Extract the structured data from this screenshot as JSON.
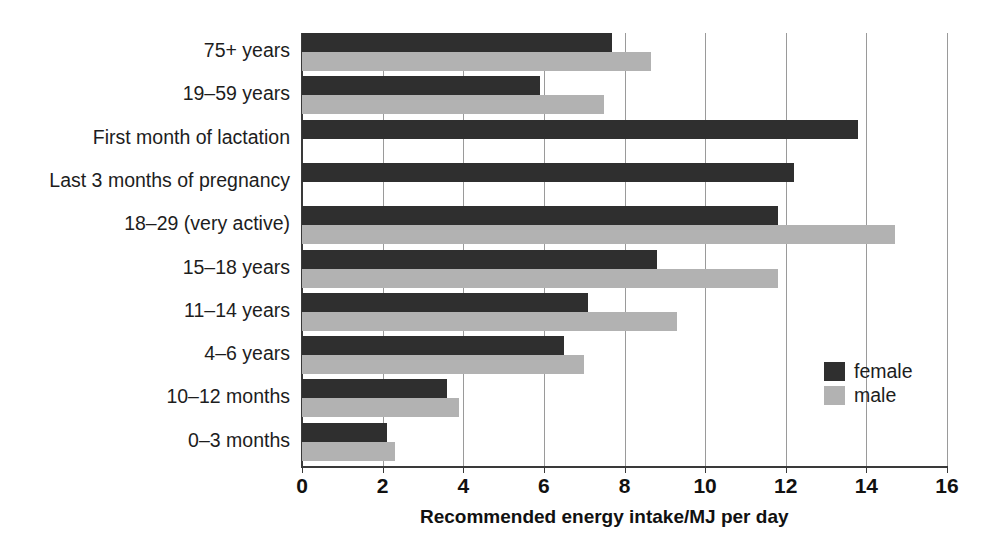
{
  "chart_data": {
    "type": "bar",
    "orientation": "horizontal",
    "title": "",
    "xlabel": "Recommended energy intake/MJ per day",
    "ylabel": "",
    "xlim": [
      0,
      16
    ],
    "xticks": [
      0,
      2,
      4,
      6,
      8,
      10,
      12,
      14,
      16
    ],
    "xtick_labels": [
      "0",
      "2",
      "4",
      "6",
      "8",
      "10",
      "12",
      "14",
      "16"
    ],
    "grid": true,
    "grid_axis": "x",
    "legend_position": "center-right",
    "categories": [
      "75+ years",
      "19–59 years",
      "First month of lactation",
      "Last 3 months of pregnancy",
      "18–29 (very active)",
      "15–18 years",
      "11–14 years",
      "4–6 years",
      "10–12 months",
      "0–3 months"
    ],
    "series": [
      {
        "name": "female",
        "color": "#2f2f2f",
        "values": [
          7.7,
          5.9,
          13.8,
          12.2,
          11.8,
          8.8,
          7.1,
          6.5,
          3.6,
          2.1
        ]
      },
      {
        "name": "male",
        "color": "#b2b2b2",
        "values": [
          8.65,
          7.5,
          null,
          null,
          14.7,
          11.8,
          9.3,
          7.0,
          3.9,
          2.3
        ]
      }
    ],
    "legend": [
      {
        "label": "female",
        "color": "#2f2f2f"
      },
      {
        "label": "male",
        "color": "#b2b2b2"
      }
    ]
  }
}
